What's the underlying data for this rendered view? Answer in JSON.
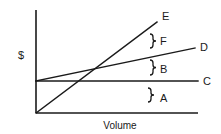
{
  "diagram": {
    "type": "cost-volume-profit chart",
    "y_axis_label": "$",
    "x_axis_label": "Volume",
    "lines": [
      {
        "id": "C",
        "label": "C",
        "description": "horizontal line (fixed cost)",
        "from": [
          0,
          32
        ],
        "to": [
          162,
          32
        ]
      },
      {
        "id": "D",
        "label": "D",
        "description": "line starting at C level rising gently (total cost)",
        "from": [
          0,
          32
        ],
        "to": [
          159,
          65
        ]
      },
      {
        "id": "E",
        "label": "E",
        "description": "line from origin rising steeply (total revenue)",
        "from": [
          0,
          0
        ],
        "to": [
          121,
          91
        ]
      }
    ],
    "regions": [
      {
        "id": "A",
        "label": "A",
        "description": "area between x-axis and line C"
      },
      {
        "id": "B",
        "label": "B",
        "description": "area between line C and line D"
      },
      {
        "id": "F",
        "label": "F",
        "description": "area between line D and line E"
      }
    ]
  },
  "labels": {
    "dollar": "$",
    "volume": "Volume",
    "E": "E",
    "F": "F",
    "D": "D",
    "B": "B",
    "C": "C",
    "A": "A"
  }
}
